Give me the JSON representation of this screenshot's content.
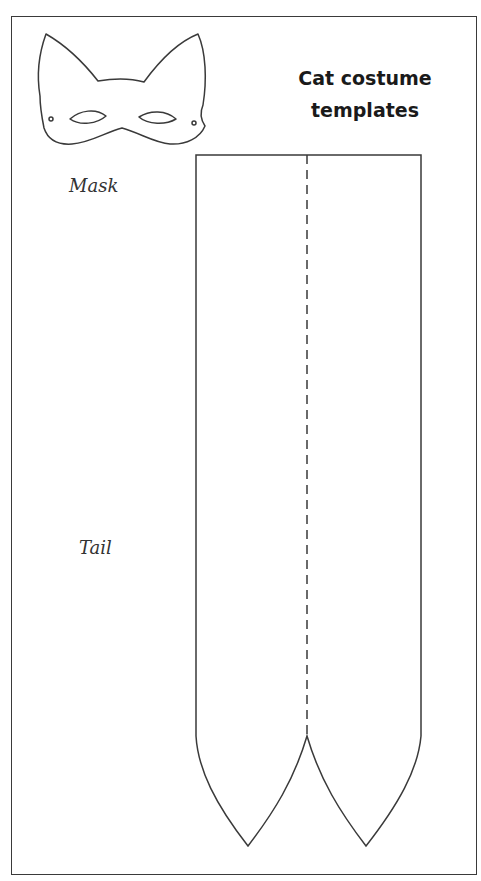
{
  "document": {
    "title_line1": "Cat costume",
    "title_line2": "templates",
    "labels": {
      "mask": "Mask",
      "tail": "Tail"
    },
    "templates": [
      {
        "name": "mask",
        "shape": "cat-mask-outline",
        "features": [
          "two pointed ears",
          "two almond eye holes",
          "two tie holes"
        ]
      },
      {
        "name": "tail",
        "shape": "double tail strip with pointed ends",
        "fold_line": "dashed center line"
      }
    ],
    "colors": {
      "line": "#3a3a3a",
      "background": "#ffffff",
      "text": "#1a1a1a"
    }
  }
}
